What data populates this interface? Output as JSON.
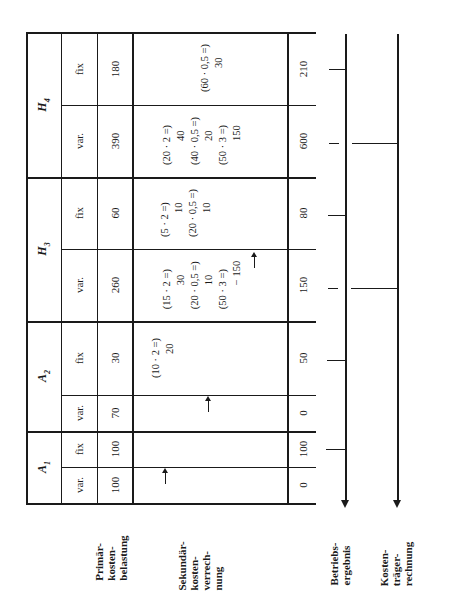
{
  "table": {
    "cost_centers": [
      {
        "id": "H4",
        "label": "H",
        "sub": "4",
        "var": {
          "type_label": "var.",
          "primary": "390",
          "result": "600",
          "secondary": [
            {
              "calc": "(20 · 2 =)",
              "value": "40"
            },
            {
              "calc": "(40 · 0,5 =)",
              "value": "20"
            },
            {
              "calc": "(50 · 3 =)",
              "value": "150"
            }
          ]
        },
        "fix": {
          "type_label": "fix",
          "primary": "180",
          "result": "210",
          "secondary": [
            {
              "calc": "(60 · 0,5 =)",
              "value": "30"
            }
          ]
        }
      },
      {
        "id": "H3",
        "label": "H",
        "sub": "3",
        "var": {
          "type_label": "var.",
          "primary": "260",
          "result": "150",
          "secondary": [
            {
              "calc": "(15 · 2 =)",
              "value": "30"
            },
            {
              "calc": "(20 · 0,5 =)",
              "value": "10"
            },
            {
              "calc": "(50 · 3 =)",
              "value": "− 150"
            }
          ]
        },
        "fix": {
          "type_label": "fix",
          "primary": "60",
          "result": "80",
          "secondary": [
            {
              "calc": "(5 · 2 =)",
              "value": "10"
            },
            {
              "calc": "(20 · 0,5 =)",
              "value": "10"
            }
          ]
        }
      },
      {
        "id": "A2",
        "label": "A",
        "sub": "2",
        "var": {
          "type_label": "var.",
          "primary": "70",
          "result": "0",
          "secondary": []
        },
        "fix": {
          "type_label": "fix",
          "primary": "30",
          "result": "50",
          "secondary": [
            {
              "calc": "(10 · 2 =)",
              "value": "20"
            }
          ]
        }
      },
      {
        "id": "A1",
        "label": "A",
        "sub": "1",
        "var": {
          "type_label": "var.",
          "primary": "100",
          "result": "0",
          "secondary": []
        },
        "fix": {
          "type_label": "fix",
          "primary": "100",
          "result": "100",
          "secondary": []
        }
      }
    ]
  },
  "row_labels": {
    "primary": "Primär-\nkosten-\nbelastung",
    "secondary": "Sekundär-\nkosten-\nverrech-\nnung",
    "betriebsergebnis": "Betriebs-\nergebnis",
    "kostentraeger": "Kosten-\nträger-\nrechnung"
  }
}
